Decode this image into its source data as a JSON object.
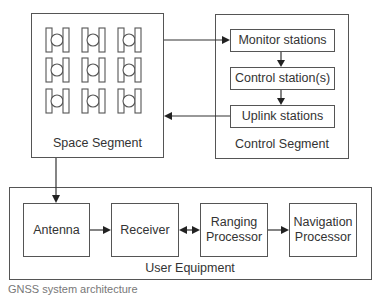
{
  "space_segment": {
    "label": "Space Segment",
    "satellite_icon": "satellite-icon",
    "satellite_rows": 3,
    "satellite_cols": 3
  },
  "control_segment": {
    "label": "Control Segment",
    "boxes": [
      {
        "label": "Monitor stations"
      },
      {
        "label": "Control station(s)"
      },
      {
        "label": "Uplink stations"
      }
    ]
  },
  "user_equipment": {
    "label": "User Equipment",
    "boxes": [
      {
        "label": "Antenna"
      },
      {
        "label": "Receiver"
      },
      {
        "label": "Ranging Processor"
      },
      {
        "label": "Navigation Processor"
      }
    ]
  },
  "caption": "GNSS system architecture",
  "colors": {
    "line": "#555555",
    "arrow": "#222222",
    "text": "#333333"
  }
}
